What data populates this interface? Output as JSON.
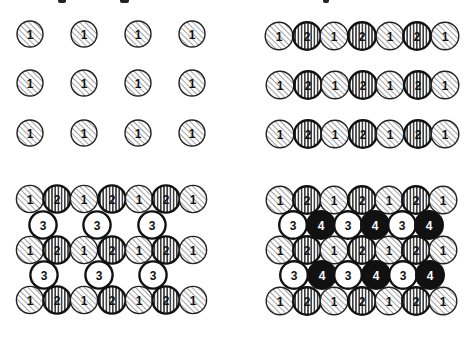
{
  "figure": {
    "top_cropped_caption_visible": false,
    "styles": {
      "1": {
        "fill": "hatch-diagonal",
        "stroke": "#222222",
        "stroke_width": 1.4,
        "text_color": "#111111"
      },
      "2": {
        "fill": "hatch-vertical",
        "stroke": "#111111",
        "stroke_width": 2.4,
        "text_color": "#111111"
      },
      "3": {
        "fill": "#ffffff",
        "stroke": "#111111",
        "stroke_width": 2.4,
        "text_color": "#111111"
      },
      "4": {
        "fill": "#111111",
        "stroke": "#111111",
        "stroke_width": 2.4,
        "text_color": "#ffffff"
      }
    },
    "panels": [
      {
        "name": "panel-top-left",
        "title": "Layer 1 only",
        "radius": 13,
        "rows": [
          {
            "y": 34,
            "atoms": [
              {
                "x": 30,
                "label": "1"
              },
              {
                "x": 84,
                "label": "1"
              },
              {
                "x": 138,
                "label": "1"
              },
              {
                "x": 192,
                "label": "1"
              }
            ]
          },
          {
            "y": 83,
            "atoms": [
              {
                "x": 30,
                "label": "1"
              },
              {
                "x": 84,
                "label": "1"
              },
              {
                "x": 138,
                "label": "1"
              },
              {
                "x": 192,
                "label": "1"
              }
            ]
          },
          {
            "y": 133,
            "atoms": [
              {
                "x": 30,
                "label": "1"
              },
              {
                "x": 84,
                "label": "1"
              },
              {
                "x": 138,
                "label": "1"
              },
              {
                "x": 192,
                "label": "1"
              }
            ]
          }
        ]
      },
      {
        "name": "panel-top-right",
        "title": "Layers 1 and 2",
        "radius": 13.8,
        "rows": [
          {
            "y": 36,
            "atoms": [
              {
                "x": 279,
                "label": "1"
              },
              {
                "x": 307,
                "label": "2"
              },
              {
                "x": 334,
                "label": "1"
              },
              {
                "x": 362,
                "label": "2"
              },
              {
                "x": 390,
                "label": "1"
              },
              {
                "x": 417,
                "label": "2"
              },
              {
                "x": 445,
                "label": "1"
              }
            ]
          },
          {
            "y": 85,
            "atoms": [
              {
                "x": 280,
                "label": "1"
              },
              {
                "x": 308,
                "label": "2"
              },
              {
                "x": 335,
                "label": "1"
              },
              {
                "x": 363,
                "label": "2"
              },
              {
                "x": 390,
                "label": "1"
              },
              {
                "x": 418,
                "label": "2"
              },
              {
                "x": 445,
                "label": "1"
              }
            ]
          },
          {
            "y": 134,
            "atoms": [
              {
                "x": 280,
                "label": "1"
              },
              {
                "x": 308,
                "label": "2"
              },
              {
                "x": 335,
                "label": "1"
              },
              {
                "x": 363,
                "label": "2"
              },
              {
                "x": 390,
                "label": "1"
              },
              {
                "x": 418,
                "label": "2"
              },
              {
                "x": 445,
                "label": "1"
              }
            ]
          }
        ]
      },
      {
        "name": "panel-bottom-left",
        "title": "Layers 1, 2 and 3",
        "radius": 13.6,
        "rows": [
          {
            "y": 199,
            "atoms": [
              {
                "x": 30,
                "label": "1"
              },
              {
                "x": 57,
                "label": "2"
              },
              {
                "x": 84,
                "label": "1"
              },
              {
                "x": 112,
                "label": "2"
              },
              {
                "x": 139,
                "label": "1"
              },
              {
                "x": 166,
                "label": "2"
              },
              {
                "x": 193,
                "label": "1"
              }
            ]
          },
          {
            "y": 225,
            "atoms": [
              {
                "x": 43,
                "label": "3"
              },
              {
                "x": 97,
                "label": "3"
              },
              {
                "x": 152,
                "label": "3"
              }
            ]
          },
          {
            "y": 250,
            "atoms": [
              {
                "x": 30,
                "label": "1"
              },
              {
                "x": 57,
                "label": "2"
              },
              {
                "x": 84,
                "label": "1"
              },
              {
                "x": 112,
                "label": "2"
              },
              {
                "x": 139,
                "label": "1"
              },
              {
                "x": 166,
                "label": "2"
              },
              {
                "x": 193,
                "label": "1"
              }
            ]
          },
          {
            "y": 275,
            "atoms": [
              {
                "x": 44,
                "label": "3"
              },
              {
                "x": 99,
                "label": "3"
              },
              {
                "x": 153,
                "label": "3"
              }
            ]
          },
          {
            "y": 300,
            "atoms": [
              {
                "x": 30,
                "label": "1"
              },
              {
                "x": 57,
                "label": "2"
              },
              {
                "x": 84,
                "label": "1"
              },
              {
                "x": 112,
                "label": "2"
              },
              {
                "x": 139,
                "label": "1"
              },
              {
                "x": 166,
                "label": "2"
              },
              {
                "x": 193,
                "label": "1"
              }
            ]
          }
        ]
      },
      {
        "name": "panel-bottom-right",
        "title": "Layers 1, 2, 3 and 4",
        "radius": 13.8,
        "rows": [
          {
            "y": 200,
            "atoms": [
              {
                "x": 280,
                "label": "1"
              },
              {
                "x": 307,
                "label": "2"
              },
              {
                "x": 334,
                "label": "1"
              },
              {
                "x": 362,
                "label": "2"
              },
              {
                "x": 389,
                "label": "1"
              },
              {
                "x": 416,
                "label": "2"
              },
              {
                "x": 443,
                "label": "1"
              }
            ]
          },
          {
            "y": 225,
            "atoms": [
              {
                "x": 293,
                "label": "3"
              },
              {
                "x": 321,
                "label": "4"
              },
              {
                "x": 348,
                "label": "3"
              },
              {
                "x": 375,
                "label": "4"
              },
              {
                "x": 402,
                "label": "3"
              },
              {
                "x": 429,
                "label": "4"
              }
            ]
          },
          {
            "y": 250,
            "atoms": [
              {
                "x": 280,
                "label": "1"
              },
              {
                "x": 307,
                "label": "2"
              },
              {
                "x": 334,
                "label": "1"
              },
              {
                "x": 362,
                "label": "2"
              },
              {
                "x": 389,
                "label": "1"
              },
              {
                "x": 416,
                "label": "2"
              },
              {
                "x": 443,
                "label": "1"
              }
            ]
          },
          {
            "y": 275,
            "atoms": [
              {
                "x": 294,
                "label": "3"
              },
              {
                "x": 322,
                "label": "4"
              },
              {
                "x": 348,
                "label": "3"
              },
              {
                "x": 376,
                "label": "4"
              },
              {
                "x": 403,
                "label": "3"
              },
              {
                "x": 430,
                "label": "4"
              }
            ]
          },
          {
            "y": 301,
            "atoms": [
              {
                "x": 280,
                "label": "1"
              },
              {
                "x": 307,
                "label": "2"
              },
              {
                "x": 334,
                "label": "1"
              },
              {
                "x": 362,
                "label": "2"
              },
              {
                "x": 389,
                "label": "1"
              },
              {
                "x": 416,
                "label": "2"
              },
              {
                "x": 443,
                "label": "1"
              }
            ]
          }
        ]
      }
    ],
    "top_fragments": [
      {
        "x": 58,
        "w": 8
      },
      {
        "x": 120,
        "w": 9
      },
      {
        "x": 323,
        "w": 6
      }
    ]
  }
}
